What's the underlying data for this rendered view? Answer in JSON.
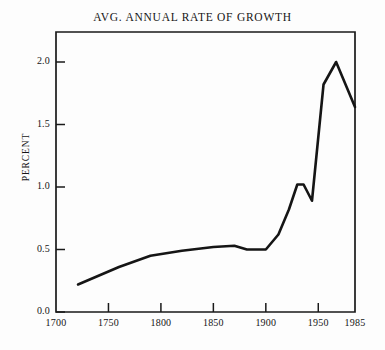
{
  "chart_data": {
    "type": "line",
    "title": "AVG. ANNUAL RATE OF GROWTH",
    "xlabel": "",
    "ylabel": "PERCENT",
    "xlim": [
      1700,
      1985
    ],
    "ylim": [
      0.0,
      2.2
    ],
    "grid": false,
    "legend": null,
    "xticks": [
      1700,
      1750,
      1800,
      1850,
      1900,
      1950,
      1985
    ],
    "xtick_labels": [
      "1700",
      "1750",
      "1800",
      "1850",
      "1900",
      "1950",
      "1985"
    ],
    "yticks": [
      0.0,
      0.5,
      1.0,
      1.5,
      2.0
    ],
    "ytick_labels": [
      "0.0",
      "0.5",
      "1.0",
      "1.5",
      "2.0"
    ],
    "series": [
      {
        "name": "Avg. annual rate of growth",
        "x": [
          1721,
          1760,
          1790,
          1820,
          1850,
          1870,
          1882,
          1900,
          1912,
          1922,
          1930,
          1936,
          1944,
          1955,
          1967,
          1985
        ],
        "values": [
          0.22,
          0.36,
          0.45,
          0.49,
          0.52,
          0.53,
          0.5,
          0.5,
          0.62,
          0.82,
          1.02,
          1.02,
          0.89,
          1.82,
          2.0,
          1.64
        ]
      }
    ]
  },
  "axes": {
    "title": "AVG. ANNUAL RATE OF GROWTH",
    "y_axis_label": "PERCENT"
  }
}
